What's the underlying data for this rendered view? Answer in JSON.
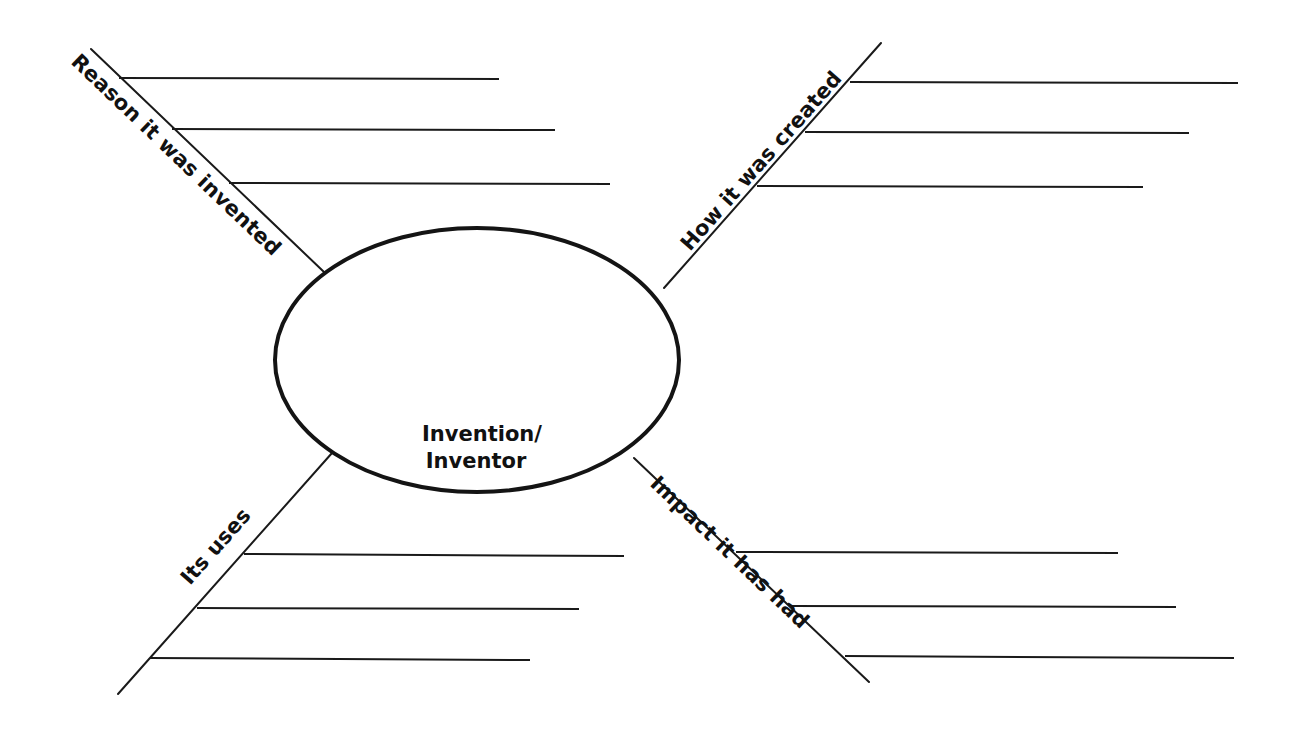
{
  "organizer": {
    "title": "Invention/Inventor graphic organizer",
    "center": {
      "line1": "Invention/",
      "line2": "Inventor"
    },
    "branches": [
      {
        "id": "top-left",
        "label": "Reason it was invented",
        "writing_lines": 3
      },
      {
        "id": "top-right",
        "label": "How it was created",
        "writing_lines": 3
      },
      {
        "id": "bottom-left",
        "label": "Its uses",
        "writing_lines": 3
      },
      {
        "id": "bottom-right",
        "label": "Impact it has had",
        "writing_lines": 3
      }
    ],
    "colors": {
      "ink": "#141414",
      "background": "#ffffff"
    }
  }
}
